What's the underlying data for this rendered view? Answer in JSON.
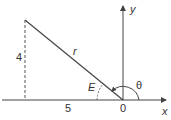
{
  "diagram": {
    "labels": {
      "opposite": "4",
      "adjacent": "5",
      "hypotenuse": "r",
      "ref_angle": "E",
      "origin": "0",
      "x_axis": "x",
      "y_axis": "y",
      "theta": "θ"
    },
    "colors": {
      "line": "#444444",
      "text": "#333333"
    }
  }
}
